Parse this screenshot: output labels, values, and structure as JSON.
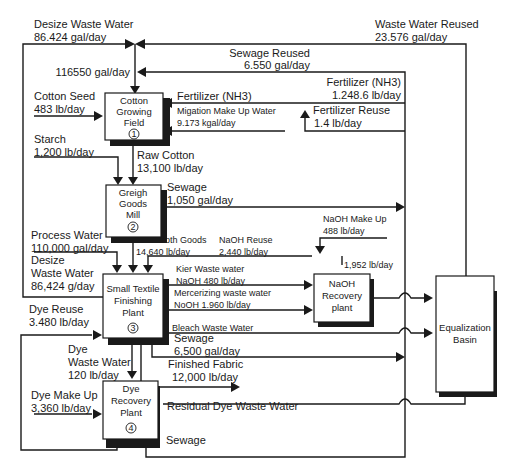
{
  "colors": {
    "ink": "#1a1a1a",
    "background": "#ffffff"
  },
  "nodes": {
    "cotton_field": {
      "lines": [
        "Cotton",
        "Growing",
        "Field"
      ],
      "number": "1"
    },
    "greigh_mill": {
      "lines": [
        "Greigh",
        "Goods",
        "Mill"
      ],
      "number": "2"
    },
    "finishing_plant": {
      "lines": [
        "Small Textile",
        "Finishing",
        "Plant"
      ],
      "number": "3"
    },
    "dye_recovery": {
      "lines": [
        "Dye",
        "Recovery",
        "Plant"
      ],
      "number": "4"
    },
    "naoh_recovery": {
      "lines": [
        "NaOH",
        "Recovery",
        "plant"
      ]
    },
    "equalization": {
      "lines": [
        "Equalization",
        "Basin"
      ]
    }
  },
  "flows": {
    "desize_waste_water_top": {
      "name": "Desize Waste Water",
      "value": "86.424 gal/day"
    },
    "waste_water_reused": {
      "name": "Waste Water Reused",
      "value": "23.576 gal/day"
    },
    "sewage_reused": {
      "name": "Sewage Reused",
      "value": "6.550 gal/day"
    },
    "water_to_field": {
      "value": "116550 gal/day"
    },
    "cotton_seed": {
      "name": "Cotton Seed",
      "value": "483 lb/day"
    },
    "fertilizer_in": {
      "name": "Fertilizer (NH3)"
    },
    "fertilizer_total": {
      "name": "Fertilizer (NH3)",
      "value": "1.248.6 lb/day"
    },
    "migation_water": {
      "name": "Migation Make Up Water",
      "value": "9.173 kgal/day"
    },
    "fertilizer_reuse": {
      "name": "Fertilizer Reuse",
      "value": "1.4 lb/day"
    },
    "starch": {
      "name": "Starch",
      "value": "1,200 lb/day"
    },
    "raw_cotton": {
      "name": "Raw Cotton",
      "value": "13,100 lb/day"
    },
    "sewage_mill": {
      "name": "Sewage",
      "value": "1,050 gal/day"
    },
    "naoh_makeup": {
      "name": "NaOH Make Up",
      "value": "488 lb/day"
    },
    "process_water": {
      "name": "Process Water",
      "value": "110,000 gal/day"
    },
    "raw_cloth": {
      "name": "Raw Cloth Goods",
      "value": "14,640 lb/day"
    },
    "naoh_reuse": {
      "name": "NaOH Reuse",
      "value": "2,440 lb/day"
    },
    "naoh_loop": {
      "value": "1,952 lb/day"
    },
    "desize_waste_water_in": {
      "name_1": "Desize",
      "name_2": "Waste Water",
      "value": "86,424 g/day"
    },
    "kier_waste": {
      "name": "Kier Waste water",
      "value": "NaOH 480 lb/day"
    },
    "mercerizing_waste": {
      "name": "Mercerizing waste water",
      "value": "NoOH 1.960 lb/day"
    },
    "dye_reuse": {
      "name": "Dye Reuse",
      "value": "3.480 lb/day"
    },
    "bleach_waste": {
      "name": "Bleach Waste Water"
    },
    "sewage_plant": {
      "name": "Sewage",
      "value": "6,500 gal/day"
    },
    "dye_waste_water": {
      "name_1": "Dye",
      "name_2": "Waste Water",
      "value": "120 lb/day"
    },
    "finished_fabric": {
      "name": "Finished Fabric",
      "value": "12,000 lb/day"
    },
    "dye_makeup": {
      "name": "Dye Make Up",
      "value": "3,360 lb/day"
    },
    "residual_dye": {
      "name": "Residual Dye Waste Water"
    },
    "sewage_dye": {
      "name": "Sewage"
    }
  }
}
